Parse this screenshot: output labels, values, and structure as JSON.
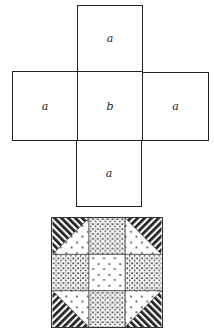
{
  "net_diagram": {
    "squares": [
      {
        "position": "top",
        "label": "a"
      },
      {
        "position": "left",
        "label": "a"
      },
      {
        "position": "center",
        "label": "b"
      },
      {
        "position": "right",
        "label": "a"
      },
      {
        "position": "bottom",
        "label": "a"
      }
    ]
  },
  "quilt_block": {
    "grid": "3x3",
    "cells": [
      {
        "row": 0,
        "col": 0,
        "type": "half-square-triangle",
        "dark_corner": "top-left"
      },
      {
        "row": 0,
        "col": 1,
        "type": "dense-dots"
      },
      {
        "row": 0,
        "col": 2,
        "type": "half-square-triangle",
        "dark_corner": "top-right"
      },
      {
        "row": 1,
        "col": 0,
        "type": "dense-dots"
      },
      {
        "row": 1,
        "col": 1,
        "type": "sparse-dots"
      },
      {
        "row": 1,
        "col": 2,
        "type": "dense-dots"
      },
      {
        "row": 2,
        "col": 0,
        "type": "half-square-triangle",
        "dark_corner": "bottom-left"
      },
      {
        "row": 2,
        "col": 1,
        "type": "dense-dots"
      },
      {
        "row": 2,
        "col": 2,
        "type": "half-square-triangle",
        "dark_corner": "bottom-right"
      }
    ]
  }
}
